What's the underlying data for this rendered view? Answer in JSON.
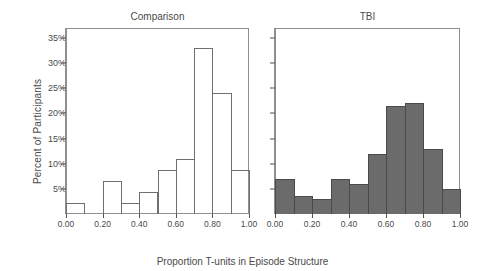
{
  "figure": {
    "ylabel": "Percent of Participants",
    "xlabel": "Proportion T-units in Episode Structure",
    "ytick_labels": [
      "5%",
      "10%",
      "15%",
      "20%",
      "25%",
      "30%",
      "35%"
    ],
    "xtick_labels": [
      "0.00",
      "0.20",
      "0.40",
      "0.60",
      "0.80",
      "1.00"
    ],
    "panel_left_title": "Comparison",
    "panel_right_title": "TBI",
    "colors": {
      "comparison_fill": "transparent",
      "comparison_stroke": "#6f6f6f",
      "tbi_fill": "#6b6b6b",
      "tbi_stroke": "#4a4a4a",
      "axis": "#8f8f8f",
      "text": "#4a4a4a"
    }
  },
  "chart_data": {
    "type": "bar",
    "title": "",
    "subtitle": "",
    "xlabel": "Proportion T-units in Episode Structure",
    "ylabel": "Percent of Participants",
    "xlim": [
      0.0,
      1.0
    ],
    "ylim": [
      0,
      37
    ],
    "grid": false,
    "legend_position": "none",
    "xtick_values": [
      0.0,
      0.2,
      0.4,
      0.6,
      0.8,
      1.0
    ],
    "xtick_labels": [
      "0.00",
      "0.20",
      "0.40",
      "0.60",
      "0.80",
      "1.00"
    ],
    "ytick_values": [
      5,
      10,
      15,
      20,
      25,
      30,
      35
    ],
    "ytick_labels": [
      "5%",
      "10%",
      "15%",
      "20%",
      "25%",
      "30%",
      "35%"
    ],
    "bin_width": 0.1,
    "bin_edges": [
      0.0,
      0.1,
      0.2,
      0.3,
      0.4,
      0.5,
      0.6,
      0.7,
      0.8,
      0.9,
      1.0
    ],
    "categories": [
      "0.0-0.1",
      "0.1-0.2",
      "0.2-0.3",
      "0.3-0.4",
      "0.4-0.5",
      "0.5-0.6",
      "0.6-0.7",
      "0.7-0.8",
      "0.8-0.9",
      "0.9-1.0"
    ],
    "panels": [
      {
        "name": "Comparison",
        "style": "open",
        "values": [
          2.2,
          0,
          6.6,
          2.2,
          4.4,
          8.8,
          11.0,
          33.0,
          24.0,
          8.8
        ]
      },
      {
        "name": "TBI",
        "style": "filled",
        "values": [
          7.0,
          3.5,
          3.0,
          7.0,
          6.0,
          12.0,
          21.5,
          22.0,
          13.0,
          5.0
        ]
      }
    ]
  }
}
